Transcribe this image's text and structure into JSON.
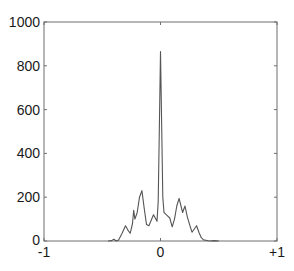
{
  "chart_data": {
    "type": "line",
    "title": "",
    "xlabel": "",
    "ylabel": "",
    "xlim": [
      -1,
      1
    ],
    "ylim": [
      0,
      1000
    ],
    "grid": false,
    "legend": null,
    "xticks": [
      -1,
      0,
      1
    ],
    "xtick_labels": [
      "-1",
      "0",
      "+1"
    ],
    "yticks": [
      0,
      200,
      400,
      600,
      800,
      1000
    ],
    "ytick_labels": [
      "0",
      "200",
      "400",
      "600",
      "800",
      "1000"
    ],
    "series": [
      {
        "name": "signal",
        "color": "#555555",
        "x": [
          -0.45,
          -0.42,
          -0.4,
          -0.38,
          -0.36,
          -0.33,
          -0.3,
          -0.28,
          -0.26,
          -0.24,
          -0.23,
          -0.22,
          -0.2,
          -0.18,
          -0.16,
          -0.14,
          -0.12,
          -0.1,
          -0.08,
          -0.06,
          -0.04,
          -0.03,
          -0.02,
          -0.01,
          0.0,
          0.01,
          0.02,
          0.03,
          0.04,
          0.06,
          0.08,
          0.1,
          0.12,
          0.14,
          0.16,
          0.19,
          0.21,
          0.23,
          0.25,
          0.27,
          0.29,
          0.31,
          0.33,
          0.35,
          0.37,
          0.39,
          0.41,
          0.43,
          0.46,
          0.5
        ],
        "y": [
          0,
          2,
          8,
          0,
          5,
          35,
          70,
          50,
          35,
          80,
          140,
          100,
          130,
          200,
          230,
          150,
          75,
          70,
          95,
          120,
          100,
          90,
          180,
          500,
          865,
          520,
          200,
          130,
          125,
          115,
          105,
          65,
          100,
          160,
          195,
          130,
          160,
          110,
          75,
          40,
          55,
          70,
          40,
          15,
          5,
          3,
          1,
          0,
          2,
          0
        ]
      }
    ]
  },
  "axis_labels": {
    "y": [
      "1000",
      "800",
      "600",
      "400",
      "200",
      "0"
    ],
    "x": [
      "-1",
      "0",
      "+1"
    ]
  }
}
